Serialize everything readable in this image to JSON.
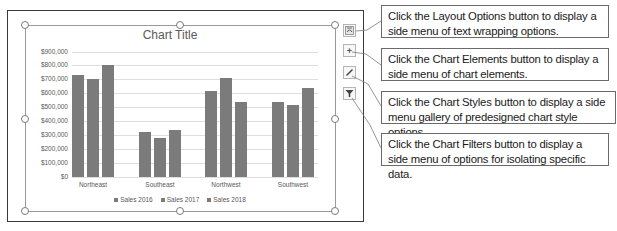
{
  "chart_data": {
    "type": "bar",
    "title": "Chart Title",
    "categories": [
      "Northeast",
      "Southeast",
      "Northwest",
      "Southwest"
    ],
    "series": [
      {
        "name": "Sales 2016",
        "values": [
          730000,
          320000,
          620000,
          540000
        ]
      },
      {
        "name": "Sales 2017",
        "values": [
          700000,
          280000,
          710000,
          515000
        ]
      },
      {
        "name": "Sales 2018",
        "values": [
          800000,
          340000,
          535000,
          640000
        ]
      }
    ],
    "xlabel": "",
    "ylabel": "",
    "ylim": [
      0,
      900000
    ],
    "yticks": [
      "$0",
      "$100,000",
      "$200,000",
      "$300,000",
      "$400,000",
      "$500,000",
      "$600,000",
      "$700,000",
      "$800,000",
      "$900,000"
    ],
    "grid": true,
    "legend_position": "bottom",
    "colors": {
      "bar": "#7b7b7b",
      "grid": "#dedede",
      "text": "#595959"
    }
  },
  "chart_buttons": {
    "layout_options": {
      "icon": "layout-options-icon",
      "glyph": "⌒"
    },
    "chart_elements": {
      "icon": "plus-icon",
      "glyph": "+"
    },
    "chart_styles": {
      "icon": "brush-icon",
      "glyph": "/"
    },
    "chart_filters": {
      "icon": "filter-icon",
      "glyph": "▼"
    }
  },
  "callouts": [
    {
      "text": "Click the Layout Options button to display a side menu of text wrapping options."
    },
    {
      "text": "Click the Chart Elements button to display a side menu of chart elements."
    },
    {
      "text": "Click the Chart Styles button to display a side menu gallery of predesigned chart style options."
    },
    {
      "text": "Click the Chart Filters button to display a side menu of options for isolating specific data."
    }
  ]
}
